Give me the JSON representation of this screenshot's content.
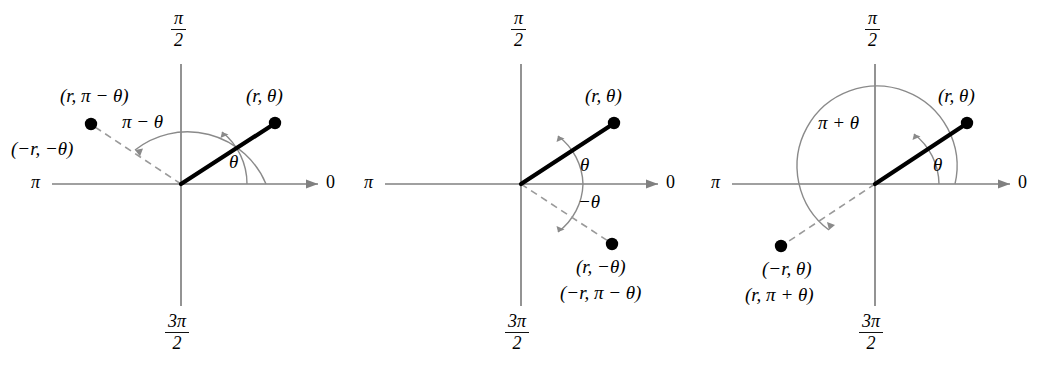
{
  "figure": {
    "type": "math-diagram",
    "background_color": "#ffffff",
    "axis_color": "#808080",
    "ray_color": "#000000",
    "dashed_color": "#9a9a9a",
    "arc_color": "#8a8a8a",
    "panel_count": 3
  },
  "axis_labels": {
    "right": "0",
    "left": "π",
    "top_numerator": "π",
    "top_denominator": "2",
    "bottom_numerator": "3π",
    "bottom_denominator": "2"
  },
  "panels": [
    {
      "id": "panel-symmetry-about-vertical-axis",
      "name": "symmetry about the line theta = pi/2",
      "origin": {
        "x": 181,
        "y": 184
      },
      "primary_point": {
        "label": "(r, θ)",
        "x": 275,
        "y": 123,
        "label_x": 246,
        "label_y": 86
      },
      "reflected_points": [
        {
          "label": "(r, π − θ)",
          "x": 91,
          "y": 124,
          "label_x": 60,
          "label_y": 86
        },
        {
          "label": "(−r, −θ)",
          "label_x": 11,
          "label_y": 139
        }
      ],
      "angle_labels": [
        {
          "text": "θ",
          "x": 229,
          "y": 152
        },
        {
          "text": "π − θ",
          "x": 122,
          "y": 112
        }
      ],
      "axis_left_label": "π",
      "axis_right_label": "0"
    },
    {
      "id": "panel-symmetry-about-horizontal-axis",
      "name": "symmetry about the polar axis (theta = 0)",
      "origin": {
        "x": 521,
        "y": 184
      },
      "primary_point": {
        "label": "(r, θ)",
        "x": 614,
        "y": 123,
        "label_x": 585,
        "label_y": 86
      },
      "reflected_points": [
        {
          "label": "(r, −θ)",
          "x": 612,
          "y": 244,
          "label_x": 576,
          "label_y": 257
        },
        {
          "label": "(−r, π − θ)",
          "label_x": 560,
          "label_y": 283
        }
      ],
      "angle_labels": [
        {
          "text": "θ",
          "x": 580,
          "y": 155
        },
        {
          "text": "−θ",
          "x": 578,
          "y": 192
        }
      ],
      "axis_left_label": "π",
      "axis_right_label": "0"
    },
    {
      "id": "panel-symmetry-about-origin",
      "name": "symmetry about the pole (origin)",
      "origin": {
        "x": 875,
        "y": 184
      },
      "primary_point": {
        "label": "(r, θ)",
        "x": 967,
        "y": 123,
        "label_x": 938,
        "label_y": 86
      },
      "reflected_points": [
        {
          "label": "(−r, θ)",
          "x": 781,
          "y": 246,
          "label_x": 762,
          "label_y": 259
        },
        {
          "label": "(r, π + θ)",
          "label_x": 745,
          "label_y": 285
        }
      ],
      "angle_labels": [
        {
          "text": "θ",
          "x": 933,
          "y": 155
        },
        {
          "text": "π + θ",
          "x": 818,
          "y": 113
        }
      ],
      "axis_left_label": "π",
      "axis_right_label": "0"
    }
  ]
}
